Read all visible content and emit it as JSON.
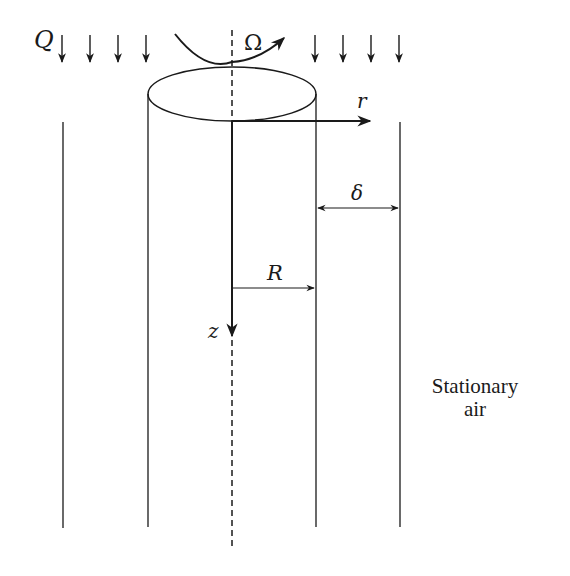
{
  "diagram": {
    "labels": {
      "flow_rate": "Q",
      "angular_velocity": "Ω",
      "radial_axis": "r",
      "gap_width": "δ",
      "radius": "R",
      "axial_axis": "z",
      "region_line1": "Stationary",
      "region_line2": "air"
    },
    "colors": {
      "stroke": "#1a1a1a",
      "background": "#ffffff"
    }
  }
}
